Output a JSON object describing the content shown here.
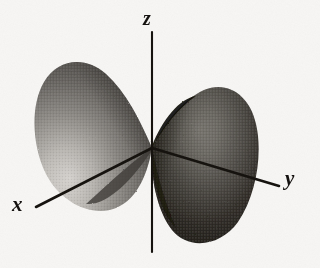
{
  "figure": {
    "kind": "3d-orbital-diagram",
    "background_color": "#f7f6f4",
    "ink_color": "#14110f"
  },
  "axes": {
    "x": {
      "label": "x",
      "label_position": {
        "x": 12,
        "y": 194
      },
      "from": {
        "x": 36,
        "y": 207
      },
      "to": {
        "x": 152,
        "y": 148
      },
      "color": "#16130f"
    },
    "y": {
      "label": "y",
      "label_position": {
        "x": 285,
        "y": 168
      },
      "from": {
        "x": 152,
        "y": 148
      },
      "to": {
        "x": 279,
        "y": 186
      },
      "color": "#16130f"
    },
    "z": {
      "label": "z",
      "label_position": {
        "x": 143,
        "y": 8
      },
      "from": {
        "x": 152,
        "y": 32
      },
      "to": {
        "x": 152,
        "y": 252
      },
      "color": "#16130f"
    },
    "origin": {
      "x": 152,
      "y": 148
    }
  },
  "lobes": [
    {
      "name": "left-lobe",
      "orientation": "upper-left",
      "tip": {
        "x": 152,
        "y": 148
      },
      "top": {
        "x": 95,
        "y": 62
      },
      "bottom": {
        "x": 110,
        "y": 211
      },
      "shading": {
        "dark": "#4d4a47",
        "mid": "#8d8a86",
        "light": "#d8d5d1"
      }
    },
    {
      "name": "right-lobe",
      "orientation": "lower-right",
      "tip": {
        "x": 152,
        "y": 148
      },
      "top": {
        "x": 214,
        "y": 88
      },
      "bottom": {
        "x": 205,
        "y": 243
      },
      "shading": {
        "dark": "#17150f",
        "mid": "#56534e",
        "light": "#918e89"
      }
    }
  ],
  "colors": {
    "background": "#f7f6f4",
    "ink": "#14110f",
    "lobe_dark": "#17150f",
    "lobe_light": "#d8d5d1"
  }
}
